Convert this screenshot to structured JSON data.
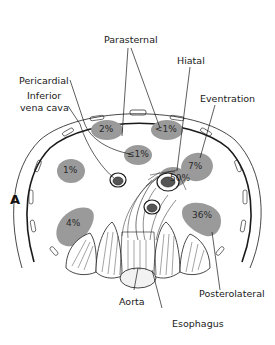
{
  "figure": {
    "panel_label": "A",
    "colors": {
      "region_fill": "#9a9a9a",
      "line": "#1a1a1a",
      "background": "#ffffff"
    }
  },
  "labels": {
    "parasternal": "Parasternal",
    "hiatal": "Hiatal",
    "pericardial": "Pericardial",
    "inferior_vena_cava_1": "Inferior",
    "inferior_vena_cava_2": "vena cava",
    "eventration": "Eventration",
    "aorta": "Aorta",
    "esophagus": "Esophagus",
    "posterolateral": "Posterolateral"
  },
  "regions": [
    {
      "name": "parasternal-right",
      "percent": "2%"
    },
    {
      "name": "parasternal-left",
      "percent": "<1%"
    },
    {
      "name": "pericardial",
      "percent": "≤1%"
    },
    {
      "name": "inferior-vena-cava",
      "percent": "1%"
    },
    {
      "name": "hiatal",
      "percent": "50%"
    },
    {
      "name": "eventration",
      "percent": "7%"
    },
    {
      "name": "posterolateral-right",
      "percent": "4%"
    },
    {
      "name": "posterolateral-left",
      "percent": "36%"
    }
  ]
}
